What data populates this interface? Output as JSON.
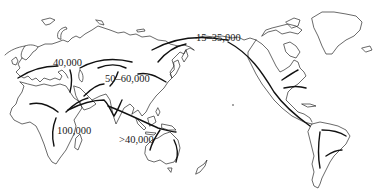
{
  "map": {
    "type": "world-outline",
    "subject": "human migration routes",
    "colors": {
      "background": "#ffffff",
      "coastline": "#2a2a2a",
      "routes": "#111111",
      "labels": "#1a1a1a"
    },
    "labels": [
      {
        "id": "europe",
        "text": "40,000",
        "x": 53,
        "y": 58
      },
      {
        "id": "asia",
        "text": "50–60,000",
        "x": 105,
        "y": 74
      },
      {
        "id": "beringia",
        "text": "15–35,000",
        "x": 196,
        "y": 33
      },
      {
        "id": "africa",
        "text": "100,000",
        "x": 57,
        "y": 126
      },
      {
        "id": "australia",
        "text": ">40,000",
        "x": 119,
        "y": 135
      }
    ]
  }
}
